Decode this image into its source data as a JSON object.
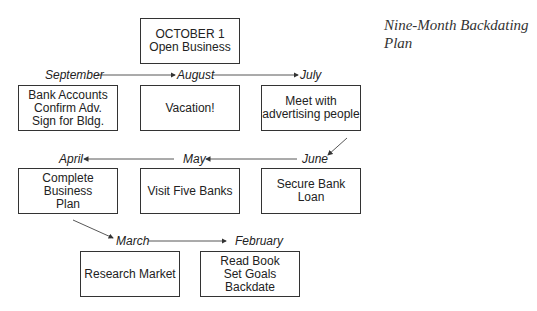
{
  "title": "Nine-Month Backdating\nPlan",
  "start": {
    "label": "OCTOBER 1\nOpen Business"
  },
  "months": [
    "September",
    "August",
    "July",
    "June",
    "May",
    "April",
    "March",
    "February"
  ],
  "tasks": {
    "september": "Bank Accounts\nConfirm Adv.\nSign for Bldg.",
    "august": "Vacation!",
    "july": "Meet with\nadvertising people",
    "june": "Secure Bank Loan",
    "may": "Visit Five Banks",
    "april": "Complete Business\nPlan",
    "march": "Research Market",
    "february": "Read Book\nSet Goals\nBackdate"
  }
}
